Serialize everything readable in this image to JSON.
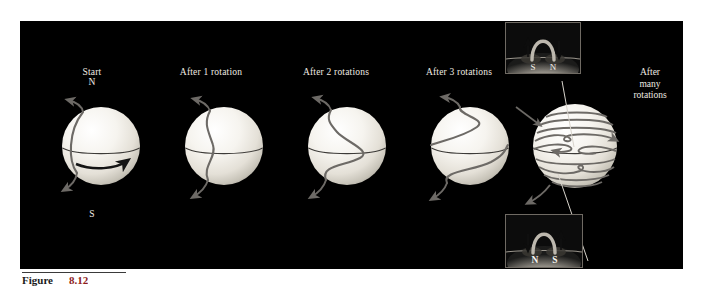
{
  "figure": {
    "caption_label": "Figure",
    "caption_number": "8.12",
    "panel_background": "#000000",
    "page_background": "#ffffff"
  },
  "colors": {
    "sphere_light": "#fbfaf7",
    "sphere_mid": "#e8e5dd",
    "sphere_shadow": "#b9b5ab",
    "field_line": "#6d6a66",
    "equator_line": "#3d3b38",
    "label_text": "#efeae2",
    "inset_border": "#6f6a63",
    "pointer_line": "#d8d4cc"
  },
  "stages": [
    {
      "id": "stage-start",
      "label": "Start",
      "pole_north": "N",
      "pole_south": "S",
      "rotation_arrow": "eastward-rotation-arrow",
      "field_line_state": "meridional",
      "cx": 81,
      "cy": 125,
      "r": 39
    },
    {
      "id": "stage-rotation-1",
      "label": "After 1 rotation",
      "field_line_state": "slightly-sheared",
      "cx": 204,
      "cy": 125,
      "r": 39
    },
    {
      "id": "stage-rotation-2",
      "label": "After 2 rotations",
      "field_line_state": "s-shaped",
      "cx": 327,
      "cy": 125,
      "r": 39
    },
    {
      "id": "stage-rotation-3",
      "label": "After 3 rotations",
      "field_line_state": "strongly-wound",
      "cx": 450,
      "cy": 125,
      "r": 39
    },
    {
      "id": "stage-many-rotations",
      "label_lines": [
        "After",
        "many",
        "rotations"
      ],
      "field_line_state": "fully-wound-toroidal",
      "wound_line_count": 10,
      "cx": 565,
      "cy": 125,
      "r": 42
    }
  ],
  "insets": [
    {
      "id": "inset-top",
      "position": "above-many-rotations-sphere",
      "loop_type": "magnetic-loop-arch",
      "polarity_left": "S",
      "polarity_right": "N",
      "arrow_left": "up-arrow",
      "arrow_right": "down-arrow"
    },
    {
      "id": "inset-bottom",
      "position": "below-many-rotations-sphere",
      "loop_type": "magnetic-loop-arch",
      "polarity_left": "N",
      "polarity_right": "S",
      "arrow_left": "down-arrow",
      "arrow_right": "up-arrow"
    }
  ]
}
